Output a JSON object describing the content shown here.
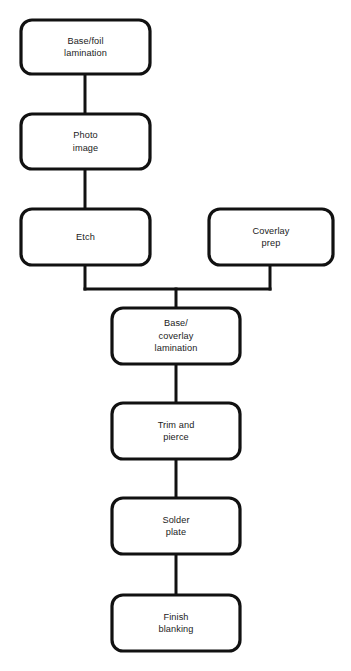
{
  "diagram": {
    "background_color": "#ffffff",
    "stroke_color": "#111111",
    "text_color": "#1b1b1b",
    "nodes": [
      {
        "id": "base-foil-lamination",
        "label": "Base/foil\nlamination",
        "x": 21,
        "y": 20,
        "w": 129,
        "h": 54
      },
      {
        "id": "photo-image",
        "label": "Photo\nimage",
        "x": 21,
        "y": 114,
        "w": 129,
        "h": 55
      },
      {
        "id": "etch",
        "label": "Etch",
        "x": 21,
        "y": 209,
        "w": 129,
        "h": 56
      },
      {
        "id": "coverlay-prep",
        "label": "Coverlay\nprep",
        "x": 209,
        "y": 209,
        "w": 124,
        "h": 56
      },
      {
        "id": "base-coverlay-lamination",
        "label": "Base/\ncoverlay\nlamination",
        "x": 112,
        "y": 308,
        "w": 128,
        "h": 56
      },
      {
        "id": "trim-and-pierce",
        "label": "Trim and\npierce",
        "x": 112,
        "y": 403,
        "w": 128,
        "h": 56
      },
      {
        "id": "solder-plate",
        "label": "Solder\nplate",
        "x": 112,
        "y": 498,
        "w": 128,
        "h": 56
      },
      {
        "id": "finish-blanking",
        "label": "Finish\nblanking",
        "x": 112,
        "y": 595,
        "w": 128,
        "h": 56
      }
    ],
    "connectors": [
      {
        "id": "base-foil-to-photo",
        "points": "85,74 85,114"
      },
      {
        "id": "photo-to-etch",
        "points": "85,169 85,209"
      },
      {
        "id": "etch-to-merge",
        "points": "85,265 85,289"
      },
      {
        "id": "coverlay-to-merge",
        "points": "270,265 270,289"
      },
      {
        "id": "merge-bar",
        "points": "85,289 270,289"
      },
      {
        "id": "merge-to-lamination",
        "points": "176,289 176,308"
      },
      {
        "id": "lamination-to-trim",
        "points": "176,364 176,403"
      },
      {
        "id": "trim-to-solder",
        "points": "176,459 176,498"
      },
      {
        "id": "solder-to-finish",
        "points": "176,554 176,595"
      }
    ]
  }
}
